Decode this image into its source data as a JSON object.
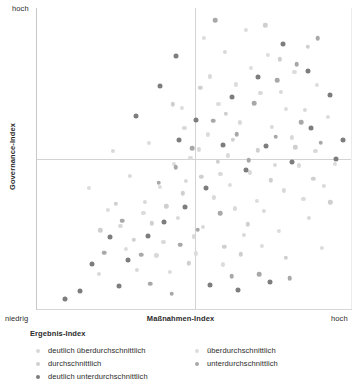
{
  "axes": {
    "y_top_label": "hoch",
    "y_title": "Governance-Index",
    "x_left_label": "niedrig",
    "x_right_label": "hoch",
    "x_title": "Maßnahmen-Index"
  },
  "legend": {
    "title": "Ergebnis-Index",
    "left_items": [
      {
        "label": "deutlich überdurchschnittlich",
        "color": "#d9d9d9"
      },
      {
        "label": "durchschnittlich",
        "color": "#cfcfcf"
      },
      {
        "label": "deutlich unterdurchschnittlich",
        "color": "#7d7d7d"
      }
    ],
    "right_items": [
      {
        "label": "überdurchschnittlich",
        "color": "#dcdcdc"
      },
      {
        "label": "unterdurchschnittlich",
        "color": "#a8a8a8"
      }
    ]
  },
  "chart_data": {
    "type": "scatter",
    "title": "",
    "xlabel": "Maßnahmen-Index",
    "ylabel": "Governance-Index",
    "xlim": [
      0,
      100
    ],
    "ylim": [
      0,
      100
    ],
    "xtick_labels": [
      "niedrig",
      "hoch"
    ],
    "ytick_labels": [
      "",
      "hoch"
    ],
    "grid": false,
    "reference_lines": {
      "x": 50,
      "y": 50
    },
    "legend_position": "below",
    "series": [
      {
        "name": "deutlich überdurchschnittlich",
        "color": "#d9d9d9",
        "points": [
          [
            64.4,
            62.0
          ],
          [
            70.9,
            71.8
          ],
          [
            77.5,
            72.1
          ],
          [
            74.5,
            60.5
          ],
          [
            85.1,
            66.2
          ],
          [
            80.8,
            57.0
          ],
          [
            60.5,
            51.0
          ],
          [
            51.3,
            53.0
          ],
          [
            58.2,
            45.0
          ],
          [
            47.4,
            42.6
          ],
          [
            67.7,
            45.4
          ],
          [
            75.5,
            48.0
          ],
          [
            83.1,
            47.7
          ],
          [
            88.4,
            52.4
          ],
          [
            56.2,
            37.1
          ],
          [
            62.8,
            33.4
          ],
          [
            72.0,
            32.5
          ],
          [
            44.7,
            30.2
          ],
          [
            52.6,
            27.3
          ],
          [
            65.8,
            24.6
          ],
          [
            40.1,
            22.4
          ],
          [
            34.2,
            35.6
          ],
          [
            29.6,
            44.1
          ],
          [
            24.1,
            52.5
          ],
          [
            46.8,
            60.2
          ],
          [
            55.0,
            77.3
          ],
          [
            59.7,
            85.4
          ],
          [
            49.8,
            24.1
          ],
          [
            78.3,
            39.4
          ],
          [
            91.2,
            41.0
          ],
          [
            86.4,
            30.2
          ],
          [
            37.9,
            17.8
          ],
          [
            26.5,
            27.6
          ],
          [
            31.7,
            13.1
          ],
          [
            19.7,
            11.6
          ]
        ]
      },
      {
        "name": "überdurchschnittlich",
        "color": "#dcdcdc",
        "points": [
          [
            68.0,
            80.2
          ],
          [
            73.4,
            84.5
          ],
          [
            81.7,
            78.9
          ],
          [
            63.1,
            74.6
          ],
          [
            57.6,
            68.1
          ],
          [
            88.9,
            74.4
          ],
          [
            92.4,
            63.8
          ],
          [
            79.1,
            66.5
          ],
          [
            54.3,
            58.0
          ],
          [
            48.7,
            50.3
          ],
          [
            43.5,
            48.2
          ],
          [
            39.1,
            40.5
          ],
          [
            33.8,
            32.0
          ],
          [
            61.3,
            41.2
          ],
          [
            69.9,
            36.0
          ],
          [
            76.8,
            25.9
          ],
          [
            84.6,
            36.7
          ],
          [
            94.7,
            48.1
          ],
          [
            50.4,
            18.5
          ],
          [
            58.9,
            14.8
          ],
          [
            42.2,
            12.3
          ],
          [
            28.3,
            20.0
          ],
          [
            22.4,
            32.8
          ],
          [
            16.6,
            40.2
          ],
          [
            35.6,
            55.1
          ],
          [
            45.9,
            66.8
          ],
          [
            53.0,
            90.1
          ],
          [
            66.2,
            92.6
          ],
          [
            71.3,
            21.0
          ],
          [
            90.5,
            20.4
          ]
        ]
      },
      {
        "name": "durchschnittlich",
        "color": "#cfcfcf",
        "points": [
          [
            62.2,
            56.3
          ],
          [
            70.1,
            52.7
          ],
          [
            57.4,
            48.9
          ],
          [
            52.1,
            44.0
          ],
          [
            46.3,
            38.4
          ],
          [
            41.0,
            34.1
          ],
          [
            36.4,
            28.5
          ],
          [
            66.9,
            28.1
          ],
          [
            74.2,
            42.8
          ],
          [
            82.0,
            53.7
          ],
          [
            87.7,
            43.2
          ],
          [
            93.1,
            35.4
          ],
          [
            59.5,
            20.6
          ],
          [
            48.1,
            15.2
          ],
          [
            30.8,
            22.9
          ],
          [
            25.0,
            35.0
          ],
          [
            20.1,
            26.1
          ],
          [
            64.7,
            18.2
          ],
          [
            78.9,
            17.0
          ],
          [
            43.1,
            68.0
          ],
          [
            51.8,
            73.5
          ],
          [
            60.0,
            64.9
          ],
          [
            77.0,
            83.0
          ],
          [
            85.9,
            87.2
          ],
          [
            72.5,
            94.3
          ]
        ]
      },
      {
        "name": "unterdurchschnittlich",
        "color": "#a8a8a8",
        "points": [
          [
            55.9,
            62.5
          ],
          [
            63.4,
            58.0
          ],
          [
            49.2,
            53.4
          ],
          [
            44.0,
            47.1
          ],
          [
            38.6,
            42.0
          ],
          [
            67.2,
            49.5
          ],
          [
            75.8,
            57.3
          ],
          [
            83.9,
            62.1
          ],
          [
            90.0,
            55.2
          ],
          [
            58.1,
            31.9
          ],
          [
            51.0,
            26.4
          ],
          [
            45.4,
            21.3
          ],
          [
            33.0,
            18.0
          ],
          [
            27.1,
            29.4
          ],
          [
            21.3,
            18.7
          ],
          [
            61.8,
            10.9
          ],
          [
            70.6,
            11.5
          ],
          [
            80.2,
            10.2
          ],
          [
            36.0,
            8.4
          ],
          [
            42.8,
            5.1
          ],
          [
            69.0,
            68.4
          ],
          [
            76.3,
            76.0
          ],
          [
            82.4,
            81.3
          ],
          [
            89.1,
            90.0
          ],
          [
            56.6,
            96.0
          ]
        ]
      },
      {
        "name": "deutlich unterdurchschnittlich",
        "color": "#7d7d7d",
        "points": [
          [
            59.0,
            54.5
          ],
          [
            66.4,
            46.3
          ],
          [
            53.7,
            40.1
          ],
          [
            47.0,
            33.8
          ],
          [
            40.4,
            29.0
          ],
          [
            72.8,
            54.0
          ],
          [
            81.0,
            49.0
          ],
          [
            87.0,
            60.0
          ],
          [
            95.0,
            49.8
          ],
          [
            35.1,
            24.2
          ],
          [
            29.0,
            16.3
          ],
          [
            23.2,
            24.0
          ],
          [
            17.4,
            15.0
          ],
          [
            54.9,
            8.0
          ],
          [
            63.9,
            6.2
          ],
          [
            74.0,
            8.9
          ],
          [
            13.5,
            6.0
          ],
          [
            45.0,
            56.0
          ],
          [
            50.5,
            62.8
          ],
          [
            62.0,
            70.4
          ],
          [
            70.0,
            77.0
          ],
          [
            78.0,
            88.0
          ],
          [
            86.0,
            79.0
          ],
          [
            93.0,
            71.0
          ],
          [
            44.2,
            84.0
          ],
          [
            39.0,
            74.0
          ],
          [
            31.5,
            64.0
          ],
          [
            9.0,
            3.4
          ],
          [
            97.0,
            56.0
          ],
          [
            26.0,
            7.8
          ]
        ]
      }
    ]
  }
}
